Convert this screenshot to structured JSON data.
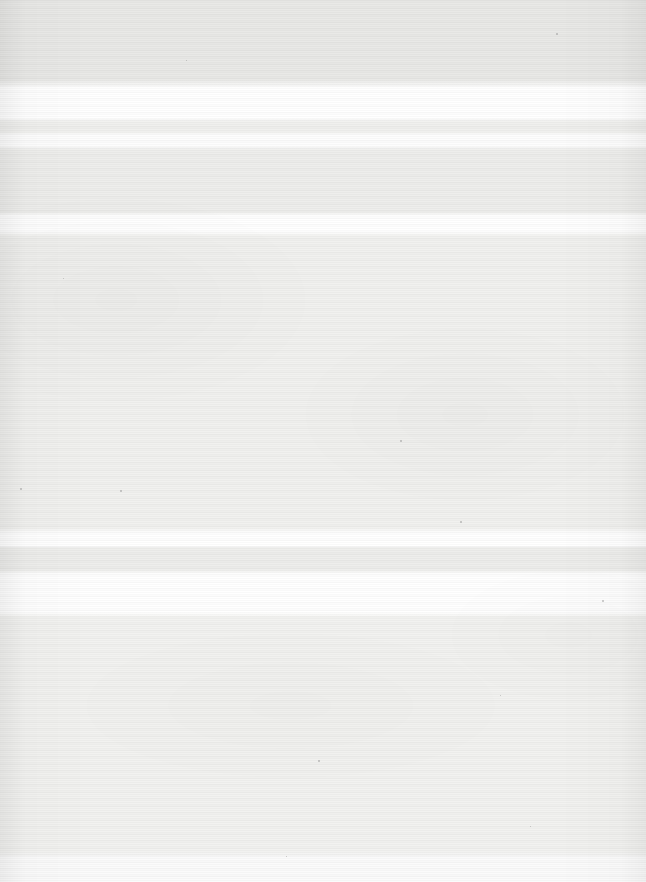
{
  "page": {
    "kind": "scanned-blank-page",
    "width_px": 646,
    "height_px": 882,
    "has_text": false,
    "has_graphics": false
  },
  "colors": {
    "paper_base": "#f2f2f0",
    "band_grey_top": "#e9e9e7",
    "band_grey_mid": "#eeeeec",
    "band_white": "#ffffff",
    "speck": "#8d8d8a",
    "page_backdrop": "#ffffff"
  },
  "scan_bands": [
    {
      "name": "top-grey-field",
      "y_start": 0,
      "y_end": 80,
      "color": "#e9e9e7"
    },
    {
      "name": "upper-white-flare",
      "y_start": 88,
      "y_end": 118,
      "color": "#ffffff"
    },
    {
      "name": "upper-grey-dip",
      "y_start": 122,
      "y_end": 132,
      "color": "#f0f0ee"
    },
    {
      "name": "upper-white-flare-2",
      "y_start": 134,
      "y_end": 146,
      "color": "#fdfdfd"
    },
    {
      "name": "mid-grey-striped-band",
      "y_start": 150,
      "y_end": 212,
      "color": "#eeeeec"
    },
    {
      "name": "second-white-flare",
      "y_start": 216,
      "y_end": 232,
      "color": "#ffffff"
    },
    {
      "name": "large-grey-field",
      "y_start": 236,
      "y_end": 528,
      "color": "#f1f1ef"
    },
    {
      "name": "lower-white-flare",
      "y_start": 533,
      "y_end": 546,
      "color": "#ffffff"
    },
    {
      "name": "lower-grey-dip",
      "y_start": 548,
      "y_end": 570,
      "color": "#eeeeec"
    },
    {
      "name": "lower-white-flare-2",
      "y_start": 574,
      "y_end": 612,
      "color": "#ffffff"
    },
    {
      "name": "bottom-grey-field",
      "y_start": 618,
      "y_end": 852,
      "color": "#f2f2f0"
    },
    {
      "name": "bottom-white-flare",
      "y_start": 858,
      "y_end": 882,
      "color": "#fbfbfb"
    }
  ],
  "specks": [
    {
      "x": 400,
      "y": 440,
      "size": 2
    },
    {
      "x": 120,
      "y": 490,
      "size": 2
    },
    {
      "x": 20,
      "y": 488,
      "size": 2
    },
    {
      "x": 460,
      "y": 521,
      "size": 2
    },
    {
      "x": 602,
      "y": 600,
      "size": 2
    },
    {
      "x": 556,
      "y": 33,
      "size": 2
    },
    {
      "x": 186,
      "y": 60,
      "size": 1
    },
    {
      "x": 318,
      "y": 760,
      "size": 2
    },
    {
      "x": 63,
      "y": 278,
      "size": 1
    },
    {
      "x": 500,
      "y": 695,
      "size": 1
    },
    {
      "x": 286,
      "y": 856,
      "size": 1
    },
    {
      "x": 530,
      "y": 826,
      "size": 1
    }
  ]
}
